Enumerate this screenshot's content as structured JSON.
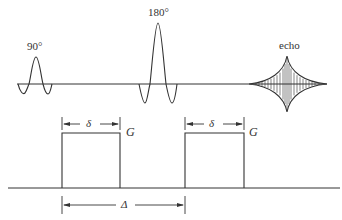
{
  "diagram": {
    "type": "pulse-sequence",
    "rf_line": {
      "pulses": [
        {
          "label": "90°"
        },
        {
          "label": "180°"
        }
      ],
      "echo_label": "echo"
    },
    "gradient_line": {
      "pulses": [
        {
          "label": "G",
          "width_label": "δ"
        },
        {
          "label": "G",
          "width_label": "δ"
        }
      ],
      "separation_label": "Δ"
    },
    "colors": {
      "line": "#333333",
      "background": "#ffffff"
    }
  }
}
